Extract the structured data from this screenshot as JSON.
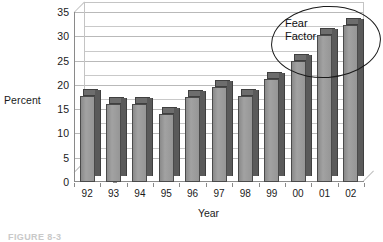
{
  "chart_data": {
    "type": "bar",
    "title": "",
    "xlabel": "Year",
    "ylabel": "Percent",
    "categories": [
      "92",
      "93",
      "94",
      "95",
      "96",
      "97",
      "98",
      "99",
      "00",
      "01",
      "02"
    ],
    "values": [
      17.8,
      16.0,
      16.1,
      14.0,
      17.6,
      19.6,
      17.7,
      21.2,
      25.0,
      30.2,
      32.4
    ],
    "ylim": [
      0,
      35
    ],
    "ytick_step": 5,
    "yticks": [
      "35",
      "30",
      "25",
      "20",
      "15",
      "10",
      "5",
      "0"
    ],
    "ytick_values": [
      35,
      30,
      25,
      20,
      15,
      10,
      5,
      0
    ],
    "grid": true,
    "legend": "none",
    "style": "3d-column",
    "annotations": [
      {
        "id": "fear-factor",
        "shape": "ellipse",
        "text_line1": "Fear",
        "text_line2": "Factor",
        "encircles": [
          "00",
          "01",
          "02"
        ]
      }
    ],
    "colors": {
      "bar_face": "#8e8e8e",
      "bar_side": "#5a5a5a",
      "bar_top": "#6d6d6d",
      "bar_outline": "#4a4a4a",
      "gridline": "#b9b9b9",
      "axis": "#8a8a8a",
      "text": "#1a1a1a",
      "annotation": "#111111",
      "background": "#ffffff"
    }
  },
  "caption": {
    "text": "FIGURE 8-3"
  }
}
